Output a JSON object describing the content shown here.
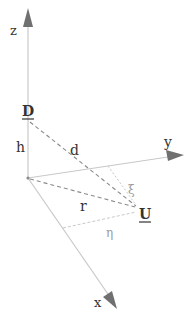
{
  "diagram": {
    "axes": {
      "z": {
        "label": "z"
      },
      "y": {
        "label": "y"
      },
      "x": {
        "label": "x"
      }
    },
    "points": {
      "D": {
        "label": "D",
        "underlined": true
      },
      "U": {
        "label": "U",
        "underlined": true
      }
    },
    "segments": {
      "h": {
        "label": "h",
        "style": "solid",
        "from": "origin",
        "to": "D"
      },
      "d": {
        "label": "d",
        "style": "dashed",
        "from": "D",
        "to": "U"
      },
      "r": {
        "label": "r",
        "style": "dashed",
        "from": "origin",
        "to": "U"
      },
      "xi": {
        "label": "ξ",
        "style": "dotted",
        "from": "y-axis",
        "to": "U"
      },
      "eta": {
        "label": "η",
        "style": "dotted",
        "from": "x-axis",
        "to": "U"
      }
    },
    "colors": {
      "axis": "#c8c8c8",
      "arrowhead": "#707070",
      "dashed": "#8a8a8a",
      "dotted": "#c0c0c0",
      "label": "#333333",
      "label_light": "#9a9a9a"
    }
  }
}
